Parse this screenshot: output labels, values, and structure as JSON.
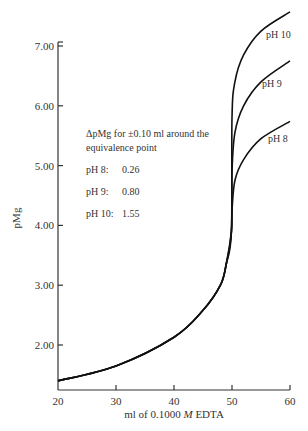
{
  "chart_data": {
    "type": "line",
    "title": "",
    "xlabel": "ml of 0.1000 M EDTA",
    "xlabel_parts": {
      "pre": "ml of 0.1000 ",
      "italic": "M",
      "post": " EDTA"
    },
    "ylabel": "pMg",
    "xlim": [
      20,
      60
    ],
    "ylim": [
      1.25,
      7.7
    ],
    "x_ticks": [
      20,
      30,
      40,
      50,
      60
    ],
    "x_tick_labels": [
      "20",
      "30",
      "40",
      "50",
      "60"
    ],
    "y_ticks": [
      2,
      3,
      4,
      5,
      6,
      7
    ],
    "y_tick_labels": [
      "2.00",
      "3.00",
      "4.00",
      "5.00",
      "6.00",
      "7.00"
    ],
    "grid": false,
    "series": [
      {
        "name": "pH 8",
        "label": "pH 8",
        "x": [
          20,
          30,
          40,
          45,
          48,
          49,
          49.9,
          50,
          50.5,
          52,
          55,
          60
        ],
        "y": [
          1.4,
          1.65,
          2.13,
          2.58,
          3.0,
          3.35,
          3.9,
          4.25,
          4.75,
          5.1,
          5.45,
          5.74
        ]
      },
      {
        "name": "pH 9",
        "label": "pH 9",
        "x": [
          20,
          30,
          40,
          45,
          48,
          49,
          49.9,
          50,
          50.5,
          52,
          55,
          60
        ],
        "y": [
          1.4,
          1.65,
          2.13,
          2.58,
          3.0,
          3.35,
          3.9,
          4.9,
          5.55,
          6.0,
          6.4,
          6.75
        ]
      },
      {
        "name": "pH 10",
        "label": "pH 10",
        "x": [
          20,
          30,
          40,
          45,
          48,
          49,
          49.9,
          50,
          50.5,
          52,
          55,
          60
        ],
        "y": [
          1.4,
          1.65,
          2.13,
          2.58,
          3.0,
          3.35,
          3.9,
          5.8,
          6.4,
          6.85,
          7.25,
          7.57
        ]
      }
    ],
    "annotations": {
      "title_line1": "ΔpMg for ±0.10 ml around the",
      "title_line2": "equivalence point",
      "rows": [
        {
          "label": "pH 8:",
          "value": "0.26"
        },
        {
          "label": "pH 9:",
          "value": "0.80"
        },
        {
          "label": "pH 10:",
          "value": "1.55"
        }
      ]
    }
  }
}
